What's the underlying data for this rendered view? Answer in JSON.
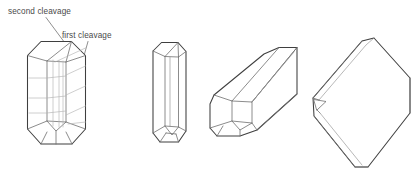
{
  "figure": {
    "background_color": "#ffffff",
    "outline_color": "#3f3f3f",
    "interior_edge_color": "#6e6e6e",
    "cleavage_trace_color": "#b3b3b3",
    "label_color": "#4a4a4a",
    "leader_color": "#6a6a6a"
  },
  "labels": [
    {
      "id": "second-cleavage",
      "text": "second cleavage",
      "x": 8,
      "y": 14,
      "leader_from": [
        46,
        17
      ],
      "leader_to": [
        72,
        52
      ]
    },
    {
      "id": "first-cleavage",
      "text": "first cleavage",
      "x": 62,
      "y": 38,
      "leader_from": [
        88,
        41
      ],
      "leader_to": [
        72,
        79
      ]
    }
  ],
  "crystals": [
    {
      "id": "crystal-1",
      "name": "prismatic-crystal-with-cleavage-traces",
      "view": "upright prism showing first and second cleavage directions"
    },
    {
      "id": "crystal-2",
      "name": "slender-prismatic-crystal",
      "view": "upright slender prism"
    },
    {
      "id": "crystal-3",
      "name": "tilted-elongate-prism",
      "view": "prism tilted toward viewer showing end face"
    },
    {
      "id": "crystal-4",
      "name": "tabular-rhomb-crystal",
      "view": "tabular rhombic crystal edge-on"
    }
  ]
}
